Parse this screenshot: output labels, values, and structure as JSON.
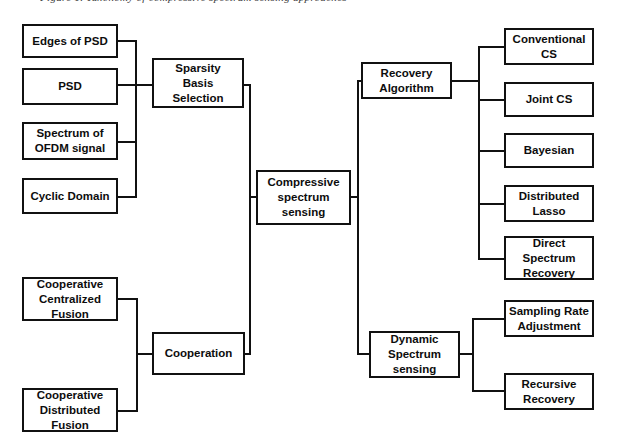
{
  "figure": {
    "caption_partial": "Figure 1. Taxonomy of compressive spectrum sensing approaches",
    "background_color": "#ffffff",
    "line_color": "#111111",
    "text_color": "#0d0d0d"
  },
  "diagram": {
    "type": "tree-taxonomy",
    "root": "Compressive spectrum sensing",
    "nodes": {
      "root": {
        "label": "Compressive\nspectrum\nsensing",
        "lines": [
          "Compressive",
          "spectrum",
          "sensing"
        ]
      },
      "sparsity_basis_selection": {
        "label": "Sparsity Basis Selection",
        "lines": [
          "Sparsity",
          "Basis",
          "Selection"
        ]
      },
      "edges_of_psd": {
        "label": "Edges of PSD",
        "lines": [
          "Edges of PSD"
        ]
      },
      "psd": {
        "label": "PSD",
        "lines": [
          "PSD"
        ]
      },
      "spectrum_of_ofdm_signal": {
        "label": "Spectrum of OFDM signal",
        "lines": [
          "Spectrum of",
          "OFDM signal"
        ]
      },
      "cyclic_domain": {
        "label": "Cyclic Domain",
        "lines": [
          "Cyclic Domain"
        ]
      },
      "cooperation": {
        "label": "Cooperation",
        "lines": [
          "Cooperation"
        ]
      },
      "cooperative_centralized_fusion": {
        "label": "Cooperative Centralized Fusion",
        "lines": [
          "Cooperative",
          "Centralized",
          "Fusion"
        ]
      },
      "cooperative_distributed_fusion": {
        "label": "Cooperative Distributed Fusion",
        "lines": [
          "Cooperative",
          "Distributed",
          "Fusion"
        ]
      },
      "recovery_algorithm": {
        "label": "Recovery Algorithm",
        "lines": [
          "Recovery",
          "Algorithm"
        ]
      },
      "conventional_cs": {
        "label": "Conventional CS",
        "lines": [
          "Conventional",
          "CS"
        ]
      },
      "joint_cs": {
        "label": "Joint CS",
        "lines": [
          "Joint CS"
        ]
      },
      "bayesian": {
        "label": "Bayesian",
        "lines": [
          "Bayesian"
        ]
      },
      "distributed_lasso": {
        "label": "Distributed Lasso",
        "lines": [
          "Distributed",
          "Lasso"
        ]
      },
      "direct_spectrum_recovery": {
        "label": "Direct Spectrum Recovery",
        "lines": [
          "Direct",
          "Spectrum",
          "Recovery"
        ]
      },
      "dynamic_spectrum_sensing": {
        "label": "Dynamic Spectrum sensing",
        "lines": [
          "Dynamic",
          "Spectrum",
          "sensing"
        ]
      },
      "sampling_rate_adjustment": {
        "label": "Sampling Rate Adjustment",
        "lines": [
          "Sampling Rate",
          "Adjustment"
        ]
      },
      "recursive_recovery": {
        "label": "Recursive Recovery",
        "lines": [
          "Recursive",
          "Recovery"
        ]
      }
    },
    "edges": [
      {
        "from": "sparsity_basis_selection",
        "to": "root"
      },
      {
        "from": "cooperation",
        "to": "root"
      },
      {
        "from": "root",
        "to": "recovery_algorithm"
      },
      {
        "from": "root",
        "to": "dynamic_spectrum_sensing"
      },
      {
        "from": "edges_of_psd",
        "to": "sparsity_basis_selection"
      },
      {
        "from": "psd",
        "to": "sparsity_basis_selection"
      },
      {
        "from": "spectrum_of_ofdm_signal",
        "to": "sparsity_basis_selection"
      },
      {
        "from": "cyclic_domain",
        "to": "sparsity_basis_selection"
      },
      {
        "from": "cooperative_centralized_fusion",
        "to": "cooperation"
      },
      {
        "from": "cooperative_distributed_fusion",
        "to": "cooperation"
      },
      {
        "from": "recovery_algorithm",
        "to": "conventional_cs"
      },
      {
        "from": "recovery_algorithm",
        "to": "joint_cs"
      },
      {
        "from": "recovery_algorithm",
        "to": "bayesian"
      },
      {
        "from": "recovery_algorithm",
        "to": "distributed_lasso"
      },
      {
        "from": "recovery_algorithm",
        "to": "direct_spectrum_recovery"
      },
      {
        "from": "dynamic_spectrum_sensing",
        "to": "sampling_rate_adjustment"
      },
      {
        "from": "dynamic_spectrum_sensing",
        "to": "recursive_recovery"
      }
    ]
  }
}
